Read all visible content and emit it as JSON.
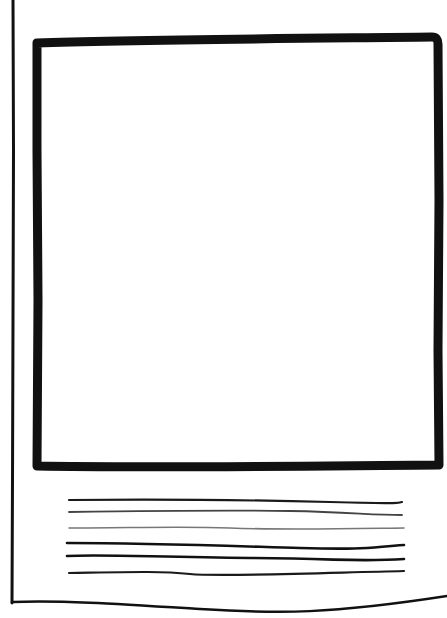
{
  "sketch": {
    "kind": "wireframe",
    "stroke_color": "#111111",
    "light_stroke_color": "#555555",
    "background": "#ffffff",
    "page_frame": {
      "left_edge": {
        "x": 12,
        "y1": 0,
        "y2": 603
      },
      "bottom_edge": {
        "y_left": 602,
        "y_mid": 612,
        "y_right": 598
      }
    },
    "image_placeholder": {
      "x": 33,
      "y": 38,
      "width": 407,
      "height": 432,
      "stroke_width": 9
    },
    "text_lines": [
      {
        "y": 500,
        "x1": 68,
        "x2": 402,
        "weight": 2.2,
        "tone": "dark"
      },
      {
        "y": 512,
        "x1": 68,
        "x2": 402,
        "weight": 1.8,
        "tone": "mid"
      },
      {
        "y": 528,
        "x1": 68,
        "x2": 404,
        "weight": 1.6,
        "tone": "light"
      },
      {
        "y": 544,
        "x1": 67,
        "x2": 404,
        "weight": 2.6,
        "tone": "dark"
      },
      {
        "y": 557,
        "x1": 67,
        "x2": 404,
        "weight": 2.6,
        "tone": "dark"
      },
      {
        "y": 572,
        "x1": 68,
        "x2": 404,
        "weight": 2.2,
        "tone": "dark"
      }
    ]
  }
}
